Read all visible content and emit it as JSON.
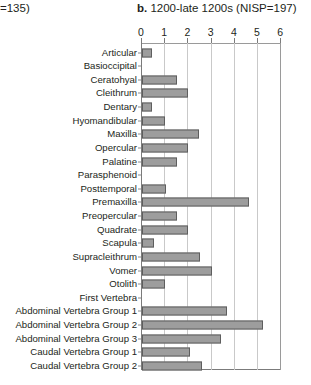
{
  "header": {
    "left_fragment": "=135)",
    "panel_letter": "b.",
    "panel_title": "1200-late 1200s (NISP=197)"
  },
  "chart_data": {
    "type": "bar",
    "orientation": "horizontal",
    "title": "b. 1200-late 1200s (NISP=197)",
    "xlabel": "",
    "ylabel": "",
    "xlim": [
      0,
      6
    ],
    "xticks": [
      0,
      1,
      2,
      3,
      4,
      5,
      6
    ],
    "xtick_labels": [
      "0",
      "1",
      "2",
      "3",
      "4",
      "5",
      "6"
    ],
    "grid": true,
    "grid_axis": "x",
    "legend": false,
    "bar_color": "#9d9d9d",
    "bar_edge_color": "#5e5e5e",
    "categories": [
      "Articular",
      "Basioccipital",
      "Ceratohyal",
      "Cleithrum",
      "Dentary",
      "Hyomandibular",
      "Maxilla",
      "Opercular",
      "Palatine",
      "Parasphenoid",
      "Posttemporal",
      "Premaxilla",
      "Preopercular",
      "Quadrate",
      "Scapula",
      "Supracleithrum",
      "Vomer",
      "Otolith",
      "First Vertebra",
      "Abdominal Vertebra Group 1",
      "Abdominal Vertebra Group 2",
      "Abdominal Vertebra Group 3",
      "Caudal Vertebra Group 1",
      "Caudal Vertebra Group 2"
    ],
    "values": [
      0.45,
      0,
      1.5,
      2.0,
      0.45,
      1.0,
      2.45,
      2.0,
      1.5,
      0,
      1.05,
      4.6,
      1.5,
      2.0,
      0.5,
      2.5,
      3.0,
      1.0,
      0,
      3.65,
      5.2,
      3.4,
      2.05,
      2.6
    ]
  }
}
